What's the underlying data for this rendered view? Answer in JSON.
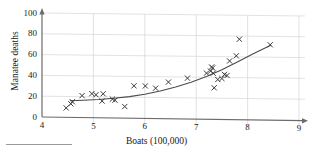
{
  "chart_data": {
    "type": "scatter",
    "title": "",
    "xlabel": "Boats (100,000)",
    "ylabel": "Manatee deaths",
    "xlim": [
      4,
      9
    ],
    "ylim": [
      0,
      100
    ],
    "xticks": [
      4,
      5,
      6,
      7,
      8,
      9
    ],
    "yticks": [
      0,
      20,
      40,
      60,
      80,
      100
    ],
    "grid": true,
    "legend": "none",
    "marker": "x",
    "points": [
      {
        "x": 4.47,
        "y": 9
      },
      {
        "x": 4.56,
        "y": 13
      },
      {
        "x": 4.59,
        "y": 15
      },
      {
        "x": 4.78,
        "y": 21
      },
      {
        "x": 4.97,
        "y": 23
      },
      {
        "x": 5.05,
        "y": 22
      },
      {
        "x": 5.17,
        "y": 16
      },
      {
        "x": 5.19,
        "y": 23
      },
      {
        "x": 5.37,
        "y": 18
      },
      {
        "x": 5.42,
        "y": 17
      },
      {
        "x": 5.61,
        "y": 11
      },
      {
        "x": 5.79,
        "y": 31
      },
      {
        "x": 6.01,
        "y": 31
      },
      {
        "x": 6.21,
        "y": 29
      },
      {
        "x": 6.46,
        "y": 35
      },
      {
        "x": 6.83,
        "y": 39
      },
      {
        "x": 7.2,
        "y": 44
      },
      {
        "x": 7.28,
        "y": 46
      },
      {
        "x": 7.3,
        "y": 50
      },
      {
        "x": 7.32,
        "y": 49
      },
      {
        "x": 7.33,
        "y": 44
      },
      {
        "x": 7.35,
        "y": 30
      },
      {
        "x": 7.42,
        "y": 38
      },
      {
        "x": 7.5,
        "y": 39
      },
      {
        "x": 7.55,
        "y": 43
      },
      {
        "x": 7.6,
        "y": 42
      },
      {
        "x": 7.65,
        "y": 56
      },
      {
        "x": 7.78,
        "y": 61
      },
      {
        "x": 7.84,
        "y": 77
      },
      {
        "x": 8.44,
        "y": 72
      }
    ],
    "fit_curve": {
      "kind": "exponential",
      "x_start": 4.55,
      "x_end": 8.45,
      "points": [
        {
          "x": 4.55,
          "y": 16.0
        },
        {
          "x": 4.8,
          "y": 16.6
        },
        {
          "x": 5.1,
          "y": 17.5
        },
        {
          "x": 5.4,
          "y": 18.8
        },
        {
          "x": 5.7,
          "y": 20.6
        },
        {
          "x": 6.0,
          "y": 23.1
        },
        {
          "x": 6.3,
          "y": 26.3
        },
        {
          "x": 6.6,
          "y": 30.3
        },
        {
          "x": 6.9,
          "y": 35.1
        },
        {
          "x": 7.2,
          "y": 40.8
        },
        {
          "x": 7.5,
          "y": 47.5
        },
        {
          "x": 7.8,
          "y": 55.0
        },
        {
          "x": 8.1,
          "y": 63.0
        },
        {
          "x": 8.45,
          "y": 71.5
        }
      ]
    },
    "colors": {
      "marker": "#3a3a3a",
      "curve": "#4a4a4a",
      "axis": "#6b6b6b",
      "grid": "#d6d6d6",
      "text": "#1a1a1a"
    }
  }
}
